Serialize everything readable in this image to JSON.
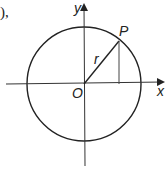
{
  "fragment_text": "),",
  "diagram": {
    "type": "unit-circle",
    "labels": {
      "y_axis": "y",
      "x_axis": "x",
      "origin": "O",
      "point": "P",
      "radius": "r"
    },
    "colors": {
      "stroke": "#222222",
      "background": "#ffffff"
    }
  }
}
